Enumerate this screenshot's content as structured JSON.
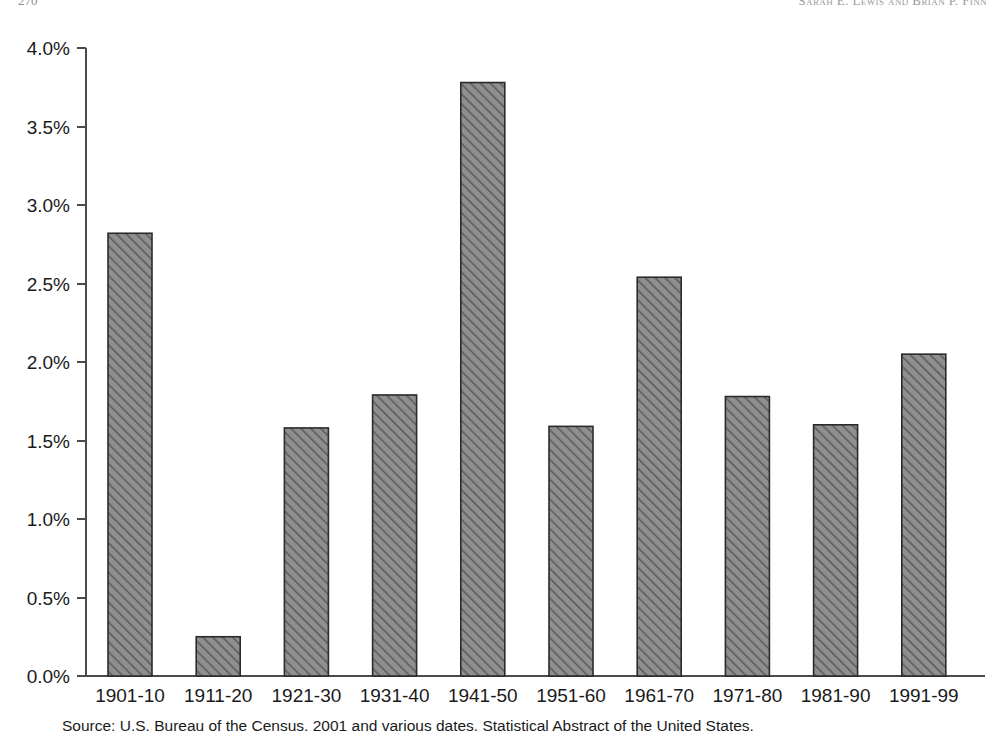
{
  "page": {
    "folio": "270",
    "running_head": "Sarah E. Lewis and Brian P. Finn"
  },
  "source_note": "Source: U.S. Bureau of the Census. 2001 and various dates. Statistical Abstract of the United States.",
  "chart_data": {
    "type": "bar",
    "title": "",
    "subtitle": "",
    "xlabel": "",
    "ylabel": "",
    "categories": [
      "1901-10",
      "1911-20",
      "1921-30",
      "1931-40",
      "1941-50",
      "1951-60",
      "1961-70",
      "1971-80",
      "1981-90",
      "1991-99"
    ],
    "values": [
      2.82,
      0.25,
      1.58,
      1.79,
      3.78,
      1.59,
      2.54,
      1.78,
      1.6,
      2.05
    ],
    "value_unit": "percent",
    "ylim": [
      0.0,
      4.0
    ],
    "ytick_values": [
      0.0,
      0.5,
      1.0,
      1.5,
      2.0,
      2.5,
      3.0,
      3.5,
      4.0
    ],
    "ytick_labels": [
      "0.0%",
      "0.5%",
      "1.0%",
      "1.5%",
      "2.0%",
      "2.5%",
      "3.0%",
      "3.5%",
      "4.0%"
    ],
    "grid": false,
    "legend": null,
    "legend_position": "none",
    "bar_fill": "#8a8a8a",
    "bar_pattern": "diagonal-hatch",
    "bar_edge_color": "#2b2b2b",
    "axis_color": "#4a4a4a",
    "background": "#ffffff"
  }
}
